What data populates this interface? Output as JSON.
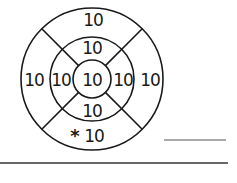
{
  "diagram": {
    "type": "dartboard",
    "center": [
      92,
      79
    ],
    "rings": {
      "outer_radius": 71,
      "middle_radius": 42,
      "inner_radius": 19
    },
    "line_color": "#1a1a1a",
    "labels": {
      "center": "10",
      "middle_top": "10",
      "middle_left": "10",
      "middle_right": "10",
      "middle_bottom": "10",
      "outer_top": "10",
      "outer_left": "10",
      "outer_right": "10",
      "outer_bottom": "10",
      "marker": "*"
    }
  },
  "answer_lines": {
    "short_line": {
      "x1": 164,
      "x2": 226,
      "y": 140
    },
    "long_line": {
      "x1": 0,
      "x2": 228,
      "y": 163
    }
  }
}
